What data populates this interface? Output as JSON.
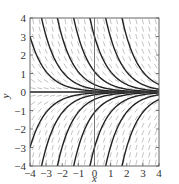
{
  "chart_data": {
    "type": "line",
    "subtype": "slope-field-with-solution-curves",
    "title": "",
    "xlabel": "x",
    "ylabel": "y",
    "xlim": [
      -4,
      4
    ],
    "ylim": [
      -4,
      4
    ],
    "xticks": [
      -4,
      -3,
      -2,
      -1,
      0,
      1,
      2,
      3,
      4
    ],
    "yticks": [
      -4,
      -3,
      -2,
      -1,
      0,
      1,
      2,
      3,
      4
    ],
    "xtick_labels": [
      "−4",
      "−3",
      "−2",
      "−1",
      "0",
      "1",
      "2",
      "3",
      "4"
    ],
    "ytick_labels": [
      "−4",
      "−3",
      "−2",
      "−1",
      "0",
      "1",
      "2",
      "3",
      "4"
    ],
    "grid": false,
    "zero_axes": true,
    "differential_equation": "dy/dx = -y",
    "solution_family": "y = C e^(-x)",
    "series": [
      {
        "name": "C=0.055",
        "C": 0.055
      },
      {
        "name": "C=0.15",
        "C": 0.15
      },
      {
        "name": "C=0.4",
        "C": 0.4
      },
      {
        "name": "C=1.1",
        "C": 1.1
      },
      {
        "name": "C=3",
        "C": 3
      },
      {
        "name": "C=8",
        "C": 8
      },
      {
        "name": "C=22",
        "C": 22
      },
      {
        "name": "C=-0.055",
        "C": -0.055
      },
      {
        "name": "C=-0.15",
        "C": -0.15
      },
      {
        "name": "C=-0.4",
        "C": -0.4
      },
      {
        "name": "C=-1.1",
        "C": -1.1
      },
      {
        "name": "C=-3",
        "C": -3
      },
      {
        "name": "C=-8",
        "C": -8
      },
      {
        "name": "C=-22",
        "C": -22
      },
      {
        "name": "C=0",
        "C": 0
      }
    ],
    "slope_field_grid": {
      "x_step": 0.4,
      "y_step": 0.4
    },
    "colors": {
      "curve": "#222222",
      "slope": "#9a9a9a",
      "frame": "#555555"
    }
  }
}
